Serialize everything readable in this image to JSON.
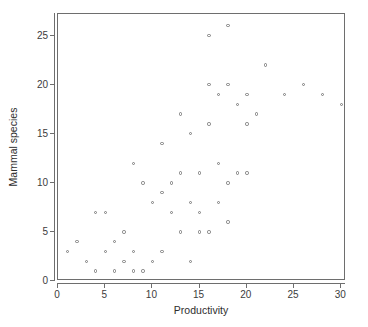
{
  "chart_data": {
    "type": "scatter",
    "title": "",
    "xlabel": "Productivity",
    "ylabel": "Mammal species",
    "xlim": [
      0,
      30.5
    ],
    "ylim": [
      0,
      27.2
    ],
    "xticks": [
      0,
      5,
      10,
      15,
      20,
      25,
      30
    ],
    "yticks": [
      0,
      5,
      10,
      15,
      20,
      25
    ],
    "xtick_labels": [
      "0",
      "5",
      "10",
      "15",
      "20",
      "25",
      "30"
    ],
    "ytick_labels": [
      "0",
      "5",
      "10",
      "15",
      "20",
      "25"
    ],
    "grid": false,
    "legend": null,
    "marker": "open-circle",
    "marker_color": "#7b7b7b",
    "frame_color": "#6e6e6e",
    "points": [
      [
        1,
        3
      ],
      [
        2,
        4
      ],
      [
        3,
        2
      ],
      [
        4,
        1
      ],
      [
        4,
        7
      ],
      [
        5,
        3
      ],
      [
        5,
        7
      ],
      [
        6,
        1
      ],
      [
        6,
        4
      ],
      [
        7,
        2
      ],
      [
        7,
        5
      ],
      [
        8,
        1
      ],
      [
        8,
        3
      ],
      [
        8,
        12
      ],
      [
        9,
        1
      ],
      [
        9,
        10
      ],
      [
        10,
        2
      ],
      [
        10,
        8
      ],
      [
        11,
        3
      ],
      [
        11,
        9
      ],
      [
        11,
        14
      ],
      [
        12,
        7
      ],
      [
        12,
        10
      ],
      [
        13,
        5
      ],
      [
        13,
        11
      ],
      [
        13,
        17
      ],
      [
        14,
        2
      ],
      [
        14,
        8
      ],
      [
        14,
        15
      ],
      [
        15,
        5
      ],
      [
        15,
        7
      ],
      [
        15,
        11
      ],
      [
        16,
        5
      ],
      [
        16,
        16
      ],
      [
        16,
        20
      ],
      [
        16,
        25
      ],
      [
        17,
        8
      ],
      [
        17,
        12
      ],
      [
        17,
        19
      ],
      [
        18,
        6
      ],
      [
        18,
        10
      ],
      [
        18,
        20
      ],
      [
        18,
        26
      ],
      [
        19,
        11
      ],
      [
        19,
        18
      ],
      [
        20,
        11
      ],
      [
        20,
        16
      ],
      [
        20,
        19
      ],
      [
        21,
        17
      ],
      [
        22,
        22
      ],
      [
        24,
        19
      ],
      [
        26,
        20
      ],
      [
        28,
        19
      ],
      [
        30,
        18
      ]
    ]
  },
  "axes": {
    "x_title": "Productivity",
    "y_title": "Mammal species"
  }
}
